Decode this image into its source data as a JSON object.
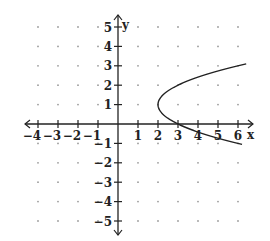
{
  "chart_data": {
    "type": "line",
    "title": "",
    "xlabel": "x",
    "ylabel": "y",
    "xlim": [
      -4,
      6
    ],
    "ylim": [
      -5,
      5
    ],
    "x_ticks": [
      -4,
      -3,
      -2,
      -1,
      1,
      2,
      3,
      4,
      5,
      6
    ],
    "y_ticks": [
      -5,
      -4,
      -3,
      -2,
      -1,
      1,
      2,
      3,
      4,
      5
    ],
    "grid": "dots",
    "series": [
      {
        "name": "parabola",
        "equation": "x = (y - 1)^2 + 2",
        "vertex": [
          2,
          1
        ],
        "points": [
          [
            6,
            3
          ],
          [
            5,
            2.73
          ],
          [
            4,
            2.41
          ],
          [
            3,
            2
          ],
          [
            2.25,
            1.5
          ],
          [
            2,
            1
          ],
          [
            2.25,
            0.5
          ],
          [
            3,
            0
          ],
          [
            4,
            -0.41
          ],
          [
            5,
            -0.73
          ],
          [
            6,
            -1
          ]
        ]
      }
    ]
  },
  "colors": {
    "axis": "#222222",
    "curve": "#222222",
    "grid_dot": "#9a9a9a"
  }
}
